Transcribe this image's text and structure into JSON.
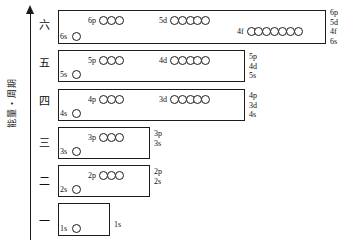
{
  "diagram": {
    "title": "",
    "axis": {
      "label": "能量・周期",
      "arrow_direction": "up"
    },
    "ink_color": "#1c1c1c",
    "background": "#ffffff",
    "shells": [
      {
        "period": "六",
        "box": {
          "x": 58,
          "y": 10,
          "w": 268,
          "h": 34
        },
        "s": {
          "tag": "6s",
          "count": 1,
          "tag_x": 60,
          "circle_y": 32
        },
        "groups": [
          {
            "tag": "6p",
            "count": 3,
            "x": 88,
            "y": 16
          },
          {
            "tag": "5d",
            "count": 5,
            "x": 159,
            "y": 16
          },
          {
            "tag": "4f",
            "count": 7,
            "x": 237,
            "y": 27
          }
        ],
        "right_labels": [
          "6p",
          "5d",
          "4f",
          "6s"
        ],
        "right_x": 330,
        "right_y": 8
      },
      {
        "period": "五",
        "box": {
          "x": 58,
          "y": 50,
          "w": 187,
          "h": 32
        },
        "s": {
          "tag": "5s",
          "count": 1,
          "tag_x": 60,
          "circle_y": 70
        },
        "groups": [
          {
            "tag": "5p",
            "count": 3,
            "x": 88,
            "y": 56
          },
          {
            "tag": "4d",
            "count": 5,
            "x": 159,
            "y": 56
          }
        ],
        "right_labels": [
          "5p",
          "4d",
          "5s"
        ],
        "right_x": 249,
        "right_y": 52
      },
      {
        "period": "四",
        "box": {
          "x": 58,
          "y": 89,
          "w": 187,
          "h": 32
        },
        "s": {
          "tag": "4s",
          "count": 1,
          "tag_x": 60,
          "circle_y": 109
        },
        "groups": [
          {
            "tag": "4p",
            "count": 3,
            "x": 88,
            "y": 95
          },
          {
            "tag": "3d",
            "count": 5,
            "x": 159,
            "y": 95
          }
        ],
        "right_labels": [
          "4p",
          "3d",
          "4s"
        ],
        "right_x": 249,
        "right_y": 91
      },
      {
        "period": "三",
        "box": {
          "x": 58,
          "y": 127,
          "w": 92,
          "h": 32
        },
        "s": {
          "tag": "3s",
          "count": 1,
          "tag_x": 60,
          "circle_y": 147
        },
        "groups": [
          {
            "tag": "3p",
            "count": 3,
            "x": 88,
            "y": 133
          }
        ],
        "right_labels": [
          "3p",
          "3s"
        ],
        "right_x": 154,
        "right_y": 129
      },
      {
        "period": "二",
        "box": {
          "x": 58,
          "y": 165,
          "w": 92,
          "h": 32
        },
        "s": {
          "tag": "2s",
          "count": 1,
          "tag_x": 60,
          "circle_y": 185
        },
        "groups": [
          {
            "tag": "2p",
            "count": 3,
            "x": 88,
            "y": 171
          }
        ],
        "right_labels": [
          "2p",
          "2s"
        ],
        "right_x": 154,
        "right_y": 167
      },
      {
        "period": "一",
        "box": {
          "x": 58,
          "y": 203,
          "w": 52,
          "h": 33
        },
        "s": {
          "tag": "1s",
          "count": 1,
          "tag_x": 60,
          "circle_y": 224
        },
        "groups": [],
        "right_labels": [
          "1s"
        ],
        "right_x": 114,
        "right_y": 220
      }
    ],
    "period_label_y": [
      20,
      58,
      96,
      138,
      176,
      216
    ]
  }
}
